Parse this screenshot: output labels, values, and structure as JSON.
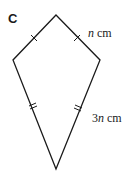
{
  "part_label": "C",
  "shape": {
    "type": "kite",
    "vertices": {
      "top": [
        56,
        15
      ],
      "left": [
        13,
        60
      ],
      "right": [
        100,
        60
      ],
      "bottom": [
        56,
        169
      ]
    },
    "stroke": "#1a1a1a"
  },
  "labels": {
    "short_side": {
      "var": "n",
      "unit": " cm"
    },
    "long_side": {
      "coef": "3",
      "var": "n",
      "unit": " cm"
    }
  }
}
